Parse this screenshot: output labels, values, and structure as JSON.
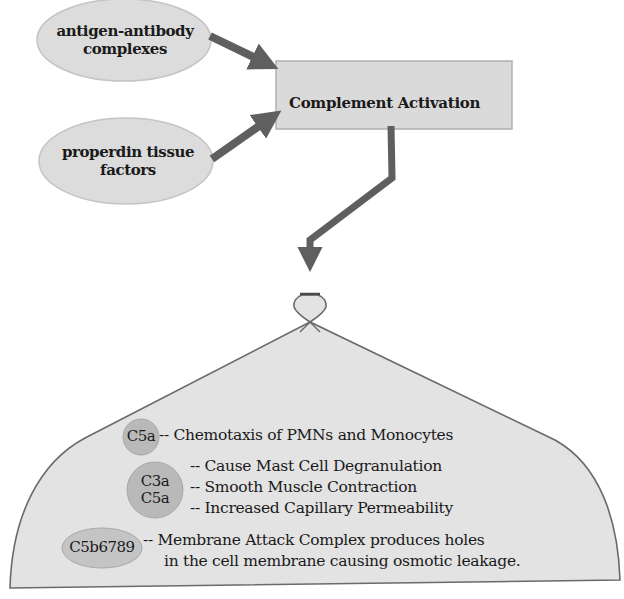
{
  "colors": {
    "node_fill": "#dcdcdc",
    "node_stroke": "#bdbdbd",
    "arrow": "#5f5f5f",
    "dome_fill": "#e3e3e3",
    "dome_stroke": "#6a6a6a",
    "badge_fill": "#b9b9b9",
    "text": "#1a1a1a"
  },
  "inputs": [
    {
      "id": "antigen-antibody",
      "lines": [
        "antigen-antibody",
        "complexes"
      ]
    },
    {
      "id": "properdin",
      "lines": [
        "properdin tissue",
        "factors"
      ]
    }
  ],
  "process": {
    "label": "Complement Activation"
  },
  "effects": {
    "c5a_chemotaxis": {
      "badge": "C5a",
      "text": "-- Chemotaxis of PMNs and Monocytes"
    },
    "c3a_c5a": {
      "badge_lines": [
        "C3a",
        "C5a"
      ],
      "items": [
        "-- Cause Mast Cell Degranulation",
        "-- Smooth Muscle Contraction",
        "-- Increased Capillary Permeability"
      ]
    },
    "mac": {
      "badge": "C5b6789",
      "lines": [
        "-- Membrane Attack Complex produces holes",
        "in the cell membrane causing osmotic leakage."
      ]
    }
  }
}
